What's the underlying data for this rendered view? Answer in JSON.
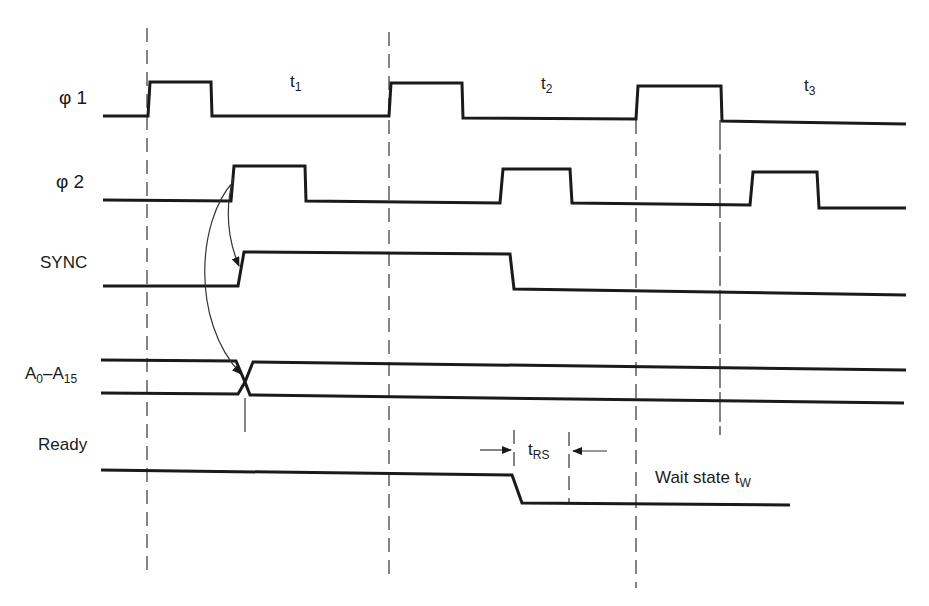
{
  "diagram": {
    "type": "timing-diagram",
    "signals": [
      {
        "id": "phi1",
        "label_symbol": "φ",
        "label_index": "1"
      },
      {
        "id": "phi2",
        "label_symbol": "φ",
        "label_index": "2"
      },
      {
        "id": "sync",
        "label": "SYNC"
      },
      {
        "id": "address",
        "label_main": "A",
        "label_sub_start": "0",
        "label_dash": "–A",
        "label_sub_end": "15"
      },
      {
        "id": "ready",
        "label": "Ready"
      }
    ],
    "states": [
      {
        "id": "t1",
        "main": "t",
        "sub": "1"
      },
      {
        "id": "t2",
        "main": "t",
        "sub": "2"
      },
      {
        "id": "t3",
        "main": "t",
        "sub": "3"
      }
    ],
    "annotations": {
      "trs": {
        "main": "t",
        "sub": "RS"
      },
      "wait_state": {
        "main": "Wait state t",
        "sub": "W"
      }
    },
    "colors": {
      "ink": "#1a1a1a",
      "background": "#ffffff"
    }
  }
}
